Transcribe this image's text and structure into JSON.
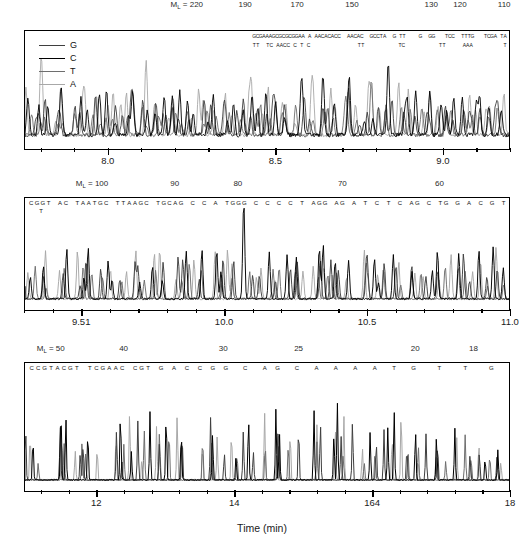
{
  "figure": {
    "x_axis_title": "Time (min)",
    "ml_prefix": "M",
    "ml_subscript": "L",
    "ml_equals": " = "
  },
  "legend": {
    "position": "top-left-inside-panel-1",
    "items": [
      {
        "label": "G",
        "color": "#3f3f3f"
      },
      {
        "label": "C",
        "color": "#000000"
      },
      {
        "label": "T",
        "color": "#6e6e6e"
      },
      {
        "label": "A",
        "color": "#a8a8a8"
      }
    ]
  },
  "panels": [
    {
      "id": "panel-1",
      "ml_first_label": "220",
      "ml_ticks": [
        {
          "value": "220",
          "pos": 0.335
        },
        {
          "value": "190",
          "pos": 0.455
        },
        {
          "value": "170",
          "pos": 0.562
        },
        {
          "value": "150",
          "pos": 0.675
        },
        {
          "value": "130",
          "pos": 0.838
        },
        {
          "value": "120",
          "pos": 0.897
        },
        {
          "value": "110",
          "pos": 0.988
        }
      ],
      "time_range": [
        7.75,
        9.2
      ],
      "time_major": [
        8.0,
        8.5,
        9.0
      ],
      "time_labels": [
        "8.0",
        "8.5",
        "9.0"
      ],
      "sequence_row_top": "GCGAAAGCGCGCGGAA A AACACACC  AACAC  GCCTA  G TT    G  GG   TCC  TTTG   TCGA TA",
      "sequence_row_bottom": "TT  TC AACC C T C              TT          TC          TT     AAA         T"
    },
    {
      "id": "panel-2",
      "ml_ticks": [
        {
          "value": "100",
          "pos": 0.14
        },
        {
          "value": "90",
          "pos": 0.31
        },
        {
          "value": "80",
          "pos": 0.44
        },
        {
          "value": "70",
          "pos": 0.655
        },
        {
          "value": "60",
          "pos": 0.855
        }
      ],
      "time_range": [
        9.3,
        11.0
      ],
      "time_major": [
        9.5,
        10.0,
        10.5,
        11.0
      ],
      "time_labels": [
        "9.51",
        "10.0",
        "10.5",
        "11.0"
      ],
      "sequence_row_top": "CGGT AC TAATGC TTAAGC TGCAG C C A TGGG C C C C T AGG AG A T C T C AG C TG G A C G T",
      "sequence_row_bottom": "T"
    },
    {
      "id": "panel-3",
      "ml_ticks": [
        {
          "value": "50",
          "pos": 0.055
        },
        {
          "value": "40",
          "pos": 0.205
        },
        {
          "value": "30",
          "pos": 0.41
        },
        {
          "value": "25",
          "pos": 0.565
        },
        {
          "value": "20",
          "pos": 0.805
        },
        {
          "value": "18",
          "pos": 0.925
        }
      ],
      "time_range": [
        10.95,
        18.0
      ],
      "time_major": [
        12,
        14,
        16,
        18
      ],
      "time_labels": [
        "12",
        "14",
        "164",
        "18"
      ],
      "sequence_row_top": "CCGTACGT TCGAAC CGT G A C C G G  C  A G  C  A  A  A  A  T  G   T   T   G",
      "sequence_row_bottom": ""
    }
  ],
  "chart_data": {
    "type": "line",
    "title": "",
    "xlabel": "Time (min)",
    "ylabel": "",
    "legend_position": "inside top-left of first panel",
    "grid": false,
    "secondary_axis": {
      "label": "M_L",
      "orientation": "top",
      "direction": "decreasing"
    },
    "series": [
      {
        "name": "G",
        "color": "#3f3f3f"
      },
      {
        "name": "C",
        "color": "#000000"
      },
      {
        "name": "T",
        "color": "#6e6e6e"
      },
      {
        "name": "A",
        "color": "#a8a8a8"
      }
    ],
    "panels": [
      {
        "name": "panel-1",
        "xlim": [
          7.75,
          9.2
        ],
        "xticks": [
          8.0,
          8.5,
          9.0
        ],
        "ml_ticks": [
          220,
          190,
          170,
          150,
          130,
          120,
          110
        ]
      },
      {
        "name": "panel-2",
        "xlim": [
          9.3,
          11.0
        ],
        "xticks": [
          9.5,
          10.0,
          10.5,
          11.0
        ],
        "ml_ticks": [
          100,
          90,
          80,
          70,
          60
        ]
      },
      {
        "name": "panel-3",
        "xlim": [
          10.95,
          18.0
        ],
        "xticks": [
          12,
          14,
          16,
          18
        ],
        "ml_ticks": [
          50,
          40,
          30,
          25,
          20,
          18
        ]
      }
    ]
  }
}
